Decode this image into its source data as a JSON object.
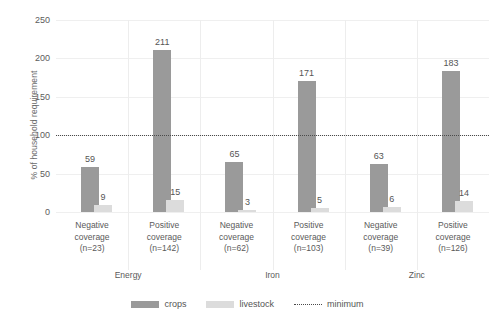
{
  "chart_data": {
    "type": "bar",
    "title": "",
    "xlabel": "",
    "ylabel": "% of household requirement",
    "ylim": [
      0,
      250
    ],
    "yticks": [
      0,
      50,
      100,
      150,
      200,
      250
    ],
    "grid": true,
    "legend_position": "bottom",
    "categories": [
      "Negative coverage (n=23)",
      "Positive coverage (n=142)",
      "Negative coverage (n=62)",
      "Positive coverage (n=103)",
      "Negative coverage (n=39)",
      "Positive coverage (n=126)"
    ],
    "category_lines": [
      [
        "Negative",
        "coverage",
        "(n=23)"
      ],
      [
        "Positive",
        "coverage",
        "(n=142)"
      ],
      [
        "Negative",
        "coverage",
        "(n=62)"
      ],
      [
        "Positive",
        "coverage",
        "(n=103)"
      ],
      [
        "Negative",
        "coverage",
        "(n=39)"
      ],
      [
        "Positive",
        "coverage",
        "(n=126)"
      ]
    ],
    "groups": [
      "Energy",
      "Iron",
      "Zinc"
    ],
    "series": [
      {
        "name": "crops",
        "color": "#9a9a9a",
        "values": [
          59,
          211,
          65,
          171,
          63,
          183
        ]
      },
      {
        "name": "livestock",
        "color": "#dcdcdc",
        "values": [
          9,
          15,
          3,
          5,
          6,
          14
        ]
      }
    ],
    "reference_line": {
      "name": "minimum",
      "value": 100,
      "style": "dotted",
      "color": "#4a4a4a"
    }
  },
  "legend": {
    "items": [
      {
        "label": "crops",
        "marker": "crops"
      },
      {
        "label": "livestock",
        "marker": "livestock"
      },
      {
        "label": "minimum",
        "marker": "minimum"
      }
    ]
  },
  "axis": {
    "y_title": "% of household requirement",
    "y_tick_labels": [
      "0",
      "50",
      "100",
      "150",
      "200",
      "250"
    ]
  }
}
